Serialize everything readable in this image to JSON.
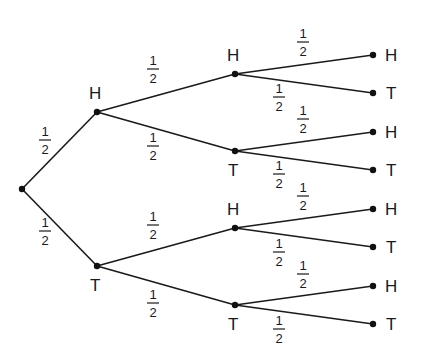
{
  "diagram": {
    "type": "probability-tree",
    "colors": {
      "line": "#1a1a1a",
      "background": "#ffffff"
    },
    "nodes": [
      {
        "id": "root",
        "x": 22,
        "y": 189,
        "label": ""
      },
      {
        "id": "H",
        "x": 97,
        "y": 112,
        "label": "H",
        "lx": 89,
        "ly": 99
      },
      {
        "id": "T",
        "x": 97,
        "y": 266,
        "label": "T",
        "lx": 90,
        "ly": 291
      },
      {
        "id": "HH",
        "x": 235,
        "y": 74,
        "label": "H",
        "lx": 227,
        "ly": 61
      },
      {
        "id": "HT",
        "x": 235,
        "y": 151,
        "label": "T",
        "lx": 228,
        "ly": 176
      },
      {
        "id": "TH",
        "x": 235,
        "y": 228,
        "label": "H",
        "lx": 227,
        "ly": 215
      },
      {
        "id": "TT",
        "x": 235,
        "y": 305,
        "label": "T",
        "lx": 228,
        "ly": 330
      },
      {
        "id": "HHH",
        "x": 373,
        "y": 55,
        "label": "H",
        "lx": 385,
        "ly": 61
      },
      {
        "id": "HHT",
        "x": 373,
        "y": 93,
        "label": "T",
        "lx": 386,
        "ly": 99
      },
      {
        "id": "HTH",
        "x": 373,
        "y": 132,
        "label": "H",
        "lx": 385,
        "ly": 138
      },
      {
        "id": "HTT",
        "x": 373,
        "y": 170,
        "label": "T",
        "lx": 386,
        "ly": 176
      },
      {
        "id": "THH",
        "x": 373,
        "y": 209,
        "label": "H",
        "lx": 385,
        "ly": 215
      },
      {
        "id": "THT",
        "x": 373,
        "y": 247,
        "label": "T",
        "lx": 386,
        "ly": 253
      },
      {
        "id": "TTH",
        "x": 373,
        "y": 286,
        "label": "H",
        "lx": 385,
        "ly": 292
      },
      {
        "id": "TTT",
        "x": 373,
        "y": 324,
        "label": "T",
        "lx": 386,
        "ly": 330
      }
    ],
    "edges": [
      {
        "from": "root",
        "to": "H",
        "prob": {
          "num": "1",
          "den": "2"
        },
        "px": 45,
        "py": 136
      },
      {
        "from": "root",
        "to": "T",
        "prob": {
          "num": "1",
          "den": "2"
        },
        "px": 45,
        "py": 227
      },
      {
        "from": "H",
        "to": "HH",
        "prob": {
          "num": "1",
          "den": "2"
        },
        "px": 153,
        "py": 65
      },
      {
        "from": "H",
        "to": "HT",
        "prob": {
          "num": "1",
          "den": "2"
        },
        "px": 153,
        "py": 142
      },
      {
        "from": "T",
        "to": "TH",
        "prob": {
          "num": "1",
          "den": "2"
        },
        "px": 153,
        "py": 221
      },
      {
        "from": "T",
        "to": "TT",
        "prob": {
          "num": "1",
          "den": "2"
        },
        "px": 153,
        "py": 299
      },
      {
        "from": "HH",
        "to": "HHH",
        "prob": {
          "num": "1",
          "den": "2"
        },
        "px": 303,
        "py": 38
      },
      {
        "from": "HH",
        "to": "HHT",
        "prob": {
          "num": "1",
          "den": "2"
        },
        "px": 279,
        "py": 93
      },
      {
        "from": "HT",
        "to": "HTH",
        "prob": {
          "num": "1",
          "den": "2"
        },
        "px": 303,
        "py": 115
      },
      {
        "from": "HT",
        "to": "HTT",
        "prob": {
          "num": "1",
          "den": "2"
        },
        "px": 279,
        "py": 170
      },
      {
        "from": "TH",
        "to": "THH",
        "prob": {
          "num": "1",
          "den": "2"
        },
        "px": 303,
        "py": 192
      },
      {
        "from": "TH",
        "to": "THT",
        "prob": {
          "num": "1",
          "den": "2"
        },
        "px": 279,
        "py": 248
      },
      {
        "from": "TT",
        "to": "TTH",
        "prob": {
          "num": "1",
          "den": "2"
        },
        "px": 303,
        "py": 270
      },
      {
        "from": "TT",
        "to": "TTT",
        "prob": {
          "num": "1",
          "den": "2"
        },
        "px": 279,
        "py": 325
      }
    ]
  }
}
